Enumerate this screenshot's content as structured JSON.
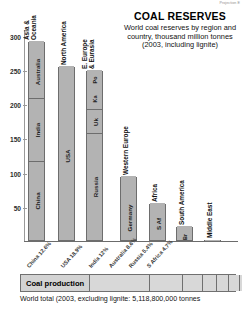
{
  "credit": "Projection E",
  "header": {
    "title": "COAL RESERVES",
    "subtitle": "World coal reserves by region and country, thousand million tonnes (2003, including lignite)"
  },
  "axis": {
    "ticks": [
      "300",
      "250",
      "200",
      "150",
      "100",
      "50"
    ],
    "unit": "thousand million tonnes"
  },
  "production": {
    "label": "Coal production",
    "footnote": "World total (2003, excluding lignite: 5,118,800,000 tonnes"
  },
  "chart_data": {
    "type": "bar",
    "title": "COAL RESERVES",
    "subtitle": "World coal reserves by region and country, thousand million tonnes (2003, including lignite)",
    "xlabel": "",
    "ylabel": "thousand million tonnes",
    "ylim": [
      0,
      310
    ],
    "yticks": [
      50,
      100,
      150,
      200,
      250,
      300
    ],
    "grid": false,
    "legend": "none",
    "stacked": true,
    "categories": [
      "Asia & Oceania",
      "North America",
      "E. Europe & Eurasia",
      "Western Europe",
      "Africa",
      "South America",
      "Middle East"
    ],
    "values": [
      292,
      256,
      250,
      95,
      55,
      22,
      2
    ],
    "bars": [
      {
        "region": "Asia & Oceania",
        "total": 292,
        "segments": [
          {
            "label": "China",
            "value": 115
          },
          {
            "label": "India",
            "value": 92
          },
          {
            "label": "Australia",
            "value": 78
          },
          {
            "label": "",
            "value": 7
          }
        ]
      },
      {
        "region": "North America",
        "total": 256,
        "segments": [
          {
            "label": "USA",
            "value": 247
          },
          {
            "label": "",
            "value": 9
          }
        ]
      },
      {
        "region": "E. Europe & Eurasia",
        "total": 250,
        "segments": [
          {
            "label": "Russia",
            "value": 157
          },
          {
            "label": "Uk",
            "value": 34
          },
          {
            "label": "Ka",
            "value": 31
          },
          {
            "label": "Po",
            "value": 28
          }
        ]
      },
      {
        "region": "Western Europe",
        "total": 95,
        "segments": [
          {
            "label": "Germany",
            "value": 67
          },
          {
            "label": "",
            "value": 28
          }
        ]
      },
      {
        "region": "Africa",
        "total": 55,
        "segments": [
          {
            "label": "S Af",
            "value": 49
          },
          {
            "label": "",
            "value": 6
          }
        ]
      },
      {
        "region": "South America",
        "total": 22,
        "segments": [
          {
            "label": "Br",
            "value": 11
          },
          {
            "label": "",
            "value": 11
          }
        ]
      },
      {
        "region": "Middle East",
        "total": 2,
        "segments": [
          {
            "label": "",
            "value": 2
          }
        ]
      }
    ],
    "country_shares": [
      {
        "label": "China 12.6%"
      },
      {
        "label": "USA 18.9%"
      },
      {
        "label": "India 12%"
      },
      {
        "label": "Australia 8.6%"
      },
      {
        "label": "Russia 5.4%"
      },
      {
        "label": "S Africa 4.7%"
      }
    ],
    "production_strip": {
      "label": "Coal production",
      "footnote": "World total (2003, excluding lignite: 5,118,800,000 tonnes"
    }
  }
}
